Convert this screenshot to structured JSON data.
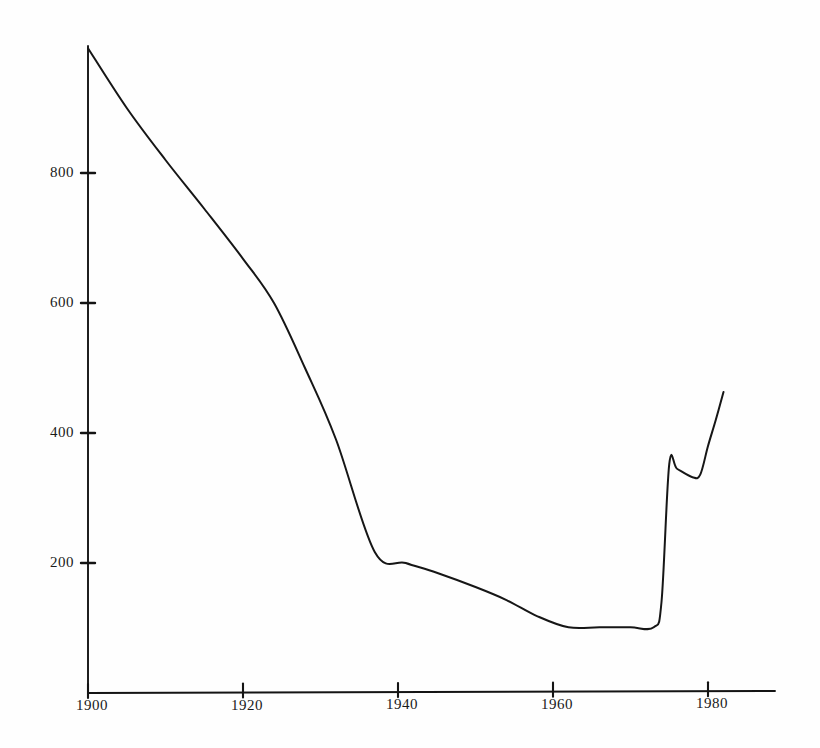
{
  "chart_data": {
    "type": "line",
    "title": "",
    "subtitle": "",
    "xlabel": "",
    "ylabel": "",
    "xlim": [
      1900,
      1985
    ],
    "ylim": [
      0,
      1000
    ],
    "grid": false,
    "legend": null,
    "axis_style": "hand-drawn scanned plot, black ink on white paper",
    "x_ticks": [
      {
        "value": 1900,
        "label": "1900"
      },
      {
        "value": 1920,
        "label": "1920"
      },
      {
        "value": 1940,
        "label": "1940"
      },
      {
        "value": 1960,
        "label": "1960"
      },
      {
        "value": 1980,
        "label": "1980"
      }
    ],
    "y_ticks": [
      {
        "value": 200,
        "label": "200"
      },
      {
        "value": 400,
        "label": "400"
      },
      {
        "value": 600,
        "label": "600"
      },
      {
        "value": 800,
        "label": "800"
      }
    ],
    "series": [
      {
        "name": "series-1",
        "color": "#161616",
        "x": [
          1900,
          1905,
          1910,
          1915,
          1920,
          1924,
          1928,
          1932,
          1937,
          1941,
          1945,
          1950,
          1954,
          1958,
          1962,
          1966,
          1970,
          1973,
          1974,
          1975,
          1976,
          1978,
          1979,
          1980,
          1981,
          1982
        ],
        "y": [
          992,
          900,
          820,
          745,
          668,
          600,
          500,
          390,
          217,
          200,
          185,
          163,
          143,
          118,
          101,
          101,
          101,
          101,
          140,
          352,
          345,
          332,
          336,
          380,
          420,
          463
        ]
      }
    ]
  },
  "geometry": {
    "x_axis_y_px": 693,
    "y_axis_x_px": 88,
    "x_px_per_year": 7.75,
    "y_px_per_unit": 0.65,
    "x_axis_right_px": 775,
    "y_axis_top_px": 46
  }
}
